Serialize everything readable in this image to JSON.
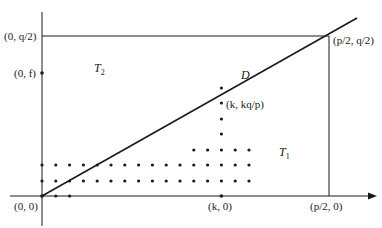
{
  "diagram": {
    "labels": {
      "origin": "(0, 0)",
      "y_q_half": "(0, q/2)",
      "y_f": "(0, f)",
      "corner": "(p/2, q/2)",
      "k_point": "(k, kq/p)",
      "k_axis": "(k, 0)",
      "p_half_axis": "(p/2, 0)",
      "line_name": "D",
      "region_upper": "T",
      "region_upper_sub": "2",
      "region_lower": "T",
      "region_lower_sub": "1"
    },
    "colors": {
      "ink": "#1a1a1a",
      "background": "#ffffff"
    }
  }
}
